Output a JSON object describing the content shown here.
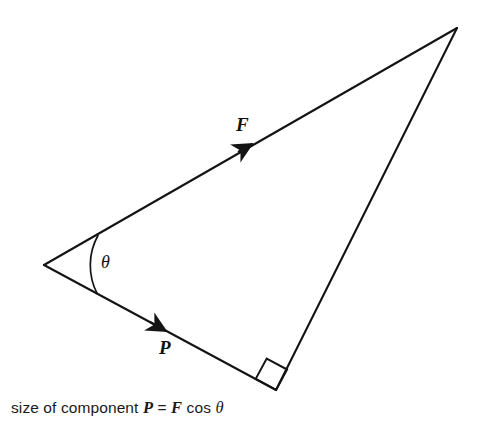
{
  "figure": {
    "type": "geometry-diagram",
    "background_color": "#ffffff",
    "stroke_color": "#141414",
    "caption": {
      "prefix": "size of component ",
      "var_p": "P",
      "equals": " = ",
      "var_f": "F",
      "cos": " cos ",
      "theta": "θ",
      "full_text": "size of component P = F cos θ"
    },
    "labels": {
      "force": "F",
      "component": "P",
      "angle": "θ"
    },
    "geometry": {
      "vertices": {
        "origin": {
          "x": 44,
          "y": 265
        },
        "apex": {
          "x": 457,
          "y": 28
        },
        "right_angle": {
          "x": 276,
          "y": 390
        }
      },
      "sides": [
        {
          "name": "force-vector-line",
          "from": "origin",
          "to": "apex",
          "label": "F",
          "arrow": true
        },
        {
          "name": "component-vector-line",
          "from": "origin",
          "to": "right_angle",
          "label": "P",
          "arrow": true
        },
        {
          "name": "closing-line",
          "from": "apex",
          "to": "right_angle",
          "label": "",
          "arrow": false
        }
      ],
      "angle_arc": {
        "at": "origin",
        "label": "θ",
        "radius": 62
      },
      "right_angle_marker": {
        "at": "right_angle",
        "size": 22
      },
      "arrowheads": [
        {
          "on": "force-vector-line",
          "x": 248,
          "y": 145
        },
        {
          "on": "component-vector-line",
          "x": 163,
          "y": 334
        }
      ]
    }
  }
}
